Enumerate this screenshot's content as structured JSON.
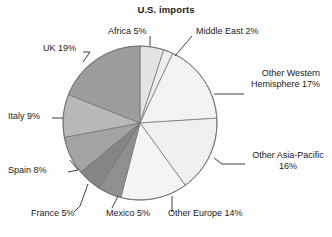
{
  "chart_data": {
    "type": "pie",
    "title": "U.S. imports",
    "xlabel": "",
    "ylabel": "",
    "legend_position": "none",
    "grid": false,
    "units": "percent",
    "start_angle_deg": 0,
    "direction": "clockwise",
    "categories": [
      "Africa",
      "Middle East",
      "Other Western Hemisphere",
      "Other Asia-Pacific",
      "Other Europe",
      "Mexico",
      "France",
      "Spain",
      "Italy",
      "UK"
    ],
    "values": [
      5,
      2,
      17,
      16,
      14,
      5,
      5,
      8,
      9,
      19
    ],
    "total": 100,
    "labels": [
      "Africa 5%",
      "Middle East 2%",
      "Other Western Hemisphere 17%",
      "Other Asia-Pacific 16%",
      "Other Europe 14%",
      "Mexico 5%",
      "France 5%",
      "Spain 8%",
      "Italy 9%",
      "UK 19%"
    ],
    "slice_colors": [
      "#e3e3e3",
      "#ededed",
      "#f2f2f2",
      "#f0f0f0",
      "#f4f4f4",
      "#8f8f8f",
      "#858585",
      "#a3a3a3",
      "#b8b8b8",
      "#9c9c9c"
    ],
    "outline_color": "#6f6f6f",
    "text_color": "#1a1a1a"
  },
  "labels": {
    "africa": "Africa 5%",
    "middle_east": "Middle East 2%",
    "other_western_hemisphere_l1": "Other Western",
    "other_western_hemisphere_l2": "Hemisphere 17%",
    "other_asia_pacific_l1": "Other Asia-Pacific",
    "other_asia_pacific_l2": "16%",
    "other_europe": "Other Europe 14%",
    "mexico": "Mexico 5%",
    "france": "France 5%",
    "spain": "Spain 8%",
    "italy": "Italy 9%",
    "uk": "UK 19%"
  }
}
